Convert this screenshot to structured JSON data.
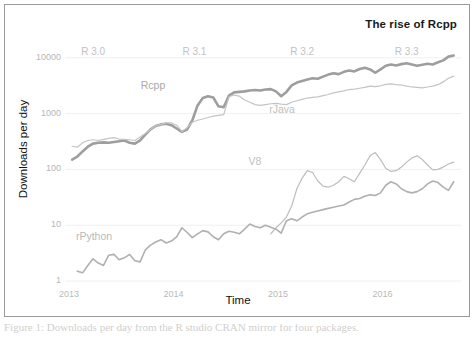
{
  "figure": {
    "title": "The rise of Rcpp",
    "border_color": "#9a9a9a",
    "background": "#ffffff"
  },
  "caption": {
    "text": "Figure 1: Downloads per day from the R studio CRAN mirror for four packages."
  },
  "chart_data": {
    "type": "line",
    "title": "The rise of Rcpp",
    "xlabel": "Time",
    "ylabel": "Downloads per day",
    "yscale": "log",
    "ylim": [
      1,
      20000
    ],
    "xlim": [
      2013.0,
      2016.75
    ],
    "grid": true,
    "legend": "inline-labels",
    "ytick_labels": [
      "10000",
      "1000",
      "100",
      "10",
      "1"
    ],
    "ytick_values": [
      10000,
      1000,
      100,
      10,
      1
    ],
    "xtick_labels": [
      "2013",
      "2014",
      "2015",
      "2016"
    ],
    "xtick_values": [
      2013,
      2014,
      2015,
      2016
    ],
    "annotations": [
      {
        "label": "R 3.0",
        "x": 2013.25,
        "y": 12000
      },
      {
        "label": "R 3.1",
        "x": 2014.22,
        "y": 12000
      },
      {
        "label": "R 3.2",
        "x": 2015.25,
        "y": 12000
      },
      {
        "label": "R 3.3",
        "x": 2016.25,
        "y": 12000
      }
    ],
    "series": [
      {
        "name": "Rcpp",
        "color": "#9e9e9e",
        "width": 2.6,
        "label_x": 2013.82,
        "label_y": 3100,
        "label_color": "#a8a8a8",
        "x": [
          2013.03,
          2013.08,
          2013.13,
          2013.18,
          2013.23,
          2013.28,
          2013.33,
          2013.38,
          2013.43,
          2013.48,
          2013.53,
          2013.58,
          2013.63,
          2013.68,
          2013.73,
          2013.78,
          2013.83,
          2013.88,
          2013.93,
          2013.98,
          2014.03,
          2014.08,
          2014.13,
          2014.18,
          2014.23,
          2014.28,
          2014.33,
          2014.38,
          2014.43,
          2014.48,
          2014.53,
          2014.58,
          2014.63,
          2014.68,
          2014.73,
          2014.78,
          2014.83,
          2014.88,
          2014.93,
          2014.98,
          2015.03,
          2015.08,
          2015.13,
          2015.18,
          2015.23,
          2015.28,
          2015.33,
          2015.38,
          2015.43,
          2015.48,
          2015.53,
          2015.58,
          2015.63,
          2015.68,
          2015.73,
          2015.78,
          2015.83,
          2015.88,
          2015.93,
          2015.98,
          2016.03,
          2016.08,
          2016.13,
          2016.18,
          2016.23,
          2016.28,
          2016.33,
          2016.38,
          2016.43,
          2016.48,
          2016.53,
          2016.58,
          2016.63,
          2016.68
        ],
        "y": [
          150,
          170,
          210,
          255,
          290,
          300,
          305,
          300,
          310,
          320,
          330,
          300,
          290,
          330,
          420,
          520,
          600,
          640,
          660,
          620,
          540,
          470,
          520,
          760,
          1400,
          1900,
          2050,
          1950,
          1350,
          1300,
          2100,
          2400,
          2450,
          2500,
          2600,
          2650,
          2600,
          2700,
          2750,
          2500,
          2050,
          2450,
          3200,
          3600,
          3850,
          4100,
          4300,
          4200,
          4600,
          5000,
          5300,
          5100,
          5600,
          5900,
          5700,
          6300,
          6600,
          6200,
          5400,
          6200,
          7200,
          7600,
          7300,
          7700,
          8000,
          7600,
          7200,
          7500,
          7800,
          7600,
          8300,
          9000,
          10500,
          11000
        ]
      },
      {
        "name": "rJava",
        "color": "#c4c4c4",
        "width": 1.2,
        "label_x": 2015.05,
        "label_y": 1150,
        "label_color": "#c0c0c0",
        "x": [
          2013.03,
          2013.08,
          2013.13,
          2013.18,
          2013.23,
          2013.28,
          2013.33,
          2013.38,
          2013.43,
          2013.48,
          2013.53,
          2013.58,
          2013.63,
          2013.68,
          2013.73,
          2013.78,
          2013.83,
          2013.88,
          2013.93,
          2013.98,
          2014.03,
          2014.08,
          2014.13,
          2014.18,
          2014.23,
          2014.28,
          2014.33,
          2014.38,
          2014.43,
          2014.48,
          2014.53,
          2014.58,
          2014.63,
          2014.68,
          2014.73,
          2014.78,
          2014.83,
          2014.88,
          2014.93,
          2014.98,
          2015.03,
          2015.08,
          2015.13,
          2015.18,
          2015.23,
          2015.28,
          2015.33,
          2015.38,
          2015.43,
          2015.48,
          2015.53,
          2015.58,
          2015.63,
          2015.68,
          2015.73,
          2015.78,
          2015.83,
          2015.88,
          2015.93,
          2015.98,
          2016.03,
          2016.08,
          2016.13,
          2016.18,
          2016.23,
          2016.28,
          2016.33,
          2016.38,
          2016.43,
          2016.48,
          2016.53,
          2016.58,
          2016.63,
          2016.68
        ],
        "y": [
          260,
          250,
          300,
          330,
          340,
          330,
          345,
          360,
          370,
          350,
          345,
          340,
          330,
          380,
          440,
          520,
          600,
          640,
          680,
          680,
          620,
          480,
          560,
          700,
          760,
          800,
          850,
          900,
          930,
          960,
          2000,
          2150,
          2050,
          1750,
          1600,
          1450,
          1400,
          1450,
          1500,
          1520,
          1480,
          1450,
          1600,
          1700,
          1800,
          1900,
          1950,
          2000,
          2100,
          2200,
          2350,
          2450,
          2550,
          2700,
          2750,
          2850,
          2950,
          3100,
          3050,
          3150,
          3350,
          3400,
          3300,
          3250,
          3100,
          3000,
          2950,
          2900,
          3000,
          3100,
          3300,
          3700,
          4300,
          4700
        ]
      },
      {
        "name": "V8",
        "color": "#bdbdbd",
        "width": 1.2,
        "label_x": 2014.85,
        "label_y": 135,
        "label_color": "#c0c0c0",
        "x": [
          2014.93,
          2014.98,
          2015.03,
          2015.08,
          2015.13,
          2015.18,
          2015.23,
          2015.28,
          2015.33,
          2015.38,
          2015.43,
          2015.48,
          2015.53,
          2015.58,
          2015.63,
          2015.68,
          2015.73,
          2015.78,
          2015.83,
          2015.88,
          2015.93,
          2015.98,
          2016.03,
          2016.08,
          2016.13,
          2016.18,
          2016.23,
          2016.28,
          2016.33,
          2016.38,
          2016.43,
          2016.48,
          2016.53,
          2016.58,
          2016.63,
          2016.68
        ],
        "y": [
          7,
          9,
          11,
          14,
          22,
          45,
          70,
          95,
          88,
          62,
          50,
          48,
          52,
          60,
          75,
          68,
          60,
          85,
          120,
          175,
          200,
          150,
          105,
          92,
          95,
          110,
          135,
          160,
          175,
          150,
          120,
          98,
          100,
          110,
          125,
          135
        ]
      },
      {
        "name": "rPython",
        "color": "#b0b0b0",
        "width": 1.6,
        "label_x": 2013.2,
        "label_y": 6.2,
        "label_color": "#b8b8b8",
        "x": [
          2013.08,
          2013.13,
          2013.18,
          2013.23,
          2013.28,
          2013.33,
          2013.38,
          2013.43,
          2013.48,
          2013.53,
          2013.58,
          2013.63,
          2013.68,
          2013.73,
          2013.78,
          2013.83,
          2013.88,
          2013.93,
          2013.98,
          2014.03,
          2014.08,
          2014.13,
          2014.18,
          2014.23,
          2014.28,
          2014.33,
          2014.38,
          2014.43,
          2014.48,
          2014.53,
          2014.58,
          2014.63,
          2014.68,
          2014.73,
          2014.78,
          2014.83,
          2014.88,
          2014.93,
          2014.98,
          2015.03,
          2015.08,
          2015.13,
          2015.18,
          2015.23,
          2015.28,
          2015.33,
          2015.38,
          2015.43,
          2015.48,
          2015.53,
          2015.58,
          2015.63,
          2015.68,
          2015.73,
          2015.78,
          2015.83,
          2015.88,
          2015.93,
          2015.98,
          2016.03,
          2016.08,
          2016.13,
          2016.18,
          2016.23,
          2016.28,
          2016.33,
          2016.38,
          2016.43,
          2016.48,
          2016.53,
          2016.58,
          2016.63,
          2016.68
        ],
        "y": [
          1.5,
          1.4,
          1.9,
          2.5,
          2.1,
          1.9,
          2.9,
          3.0,
          2.4,
          2.6,
          3.0,
          2.3,
          2.2,
          3.6,
          4.4,
          5.0,
          5.5,
          4.8,
          5.2,
          6.2,
          9.0,
          7.4,
          6.0,
          7.0,
          8.0,
          7.6,
          6.2,
          5.5,
          7.0,
          7.8,
          7.5,
          7.0,
          8.5,
          10.5,
          9.5,
          9.0,
          10.0,
          9.2,
          8.5,
          7.2,
          12.0,
          13.0,
          12.0,
          14.0,
          16.0,
          17.0,
          18.0,
          19.0,
          20.0,
          21.0,
          22.0,
          23.0,
          26.0,
          29.0,
          30.0,
          33.0,
          35.0,
          34.0,
          38.0,
          52.0,
          60.0,
          55.0,
          45.0,
          40.0,
          38.0,
          40.0,
          45.0,
          55.0,
          62.0,
          58.0,
          48.0,
          42.0,
          60.0
        ]
      }
    ]
  }
}
